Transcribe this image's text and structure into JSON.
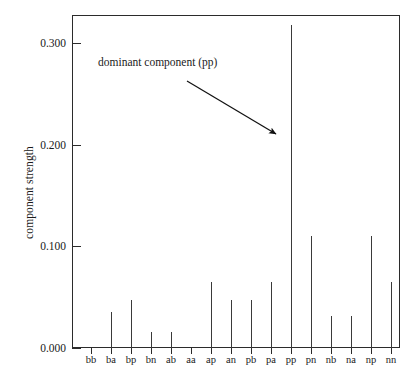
{
  "chart_data": {
    "type": "bar",
    "title": "",
    "subtitle": "",
    "xlabel": "",
    "ylabel": "component strength",
    "categories": [
      "bb",
      "ba",
      "bp",
      "bn",
      "ab",
      "aa",
      "ap",
      "an",
      "pb",
      "pa",
      "pp",
      "pn",
      "nb",
      "na",
      "np",
      "nn"
    ],
    "values": [
      0.0,
      0.035,
      0.047,
      0.016,
      0.016,
      0.0,
      0.065,
      0.047,
      0.047,
      0.065,
      0.318,
      0.11,
      0.031,
      0.031,
      0.11,
      0.065
    ],
    "ylim": [
      0.0,
      0.3276
    ],
    "yticks": [
      0.0,
      0.1,
      0.2,
      0.3
    ],
    "ytick_labels": [
      "0.000",
      "0.100",
      "0.200",
      "0.300"
    ],
    "grid": false,
    "legend": null,
    "annotations": [
      {
        "text": "dominant component (pp)",
        "points_to": "pp",
        "arrow_from_x": 187,
        "arrow_from_y": 81,
        "arrow_to_x": 281,
        "arrow_to_y": 138
      }
    ],
    "colors": {
      "spike": "#3a3a3a",
      "axis": "#2b2b2b",
      "text": "#1a1a1a",
      "background": "#ffffff"
    }
  },
  "axis": {
    "y_title": "component strength",
    "y_tick_0": "0.000",
    "y_tick_1": "0.100",
    "y_tick_2": "0.200",
    "y_tick_3": "0.300"
  },
  "xlabels": {
    "l0": "bb",
    "l1": "ba",
    "l2": "bp",
    "l3": "bn",
    "l4": "ab",
    "l5": "aa",
    "l6": "ap",
    "l7": "an",
    "l8": "pb",
    "l9": "pa",
    "l10": "pp",
    "l11": "pn",
    "l12": "nb",
    "l13": "na",
    "l14": "np",
    "l15": "nn"
  },
  "annotation": {
    "label": "dominant component (pp)"
  }
}
